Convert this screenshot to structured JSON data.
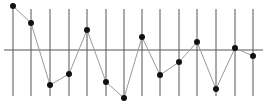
{
  "chart_data": {
    "type": "line",
    "title": "",
    "xlabel": "",
    "ylabel": "",
    "grid": "vertical lines at each point, horizontal baseline at 0",
    "legend": "none",
    "x": [
      1,
      2,
      3,
      4,
      5,
      6,
      7,
      8,
      9,
      10,
      11,
      12,
      13,
      14
    ],
    "values": [
      4.4,
      2.7,
      -3.5,
      -2.4,
      2.0,
      -3.2,
      -4.8,
      1.3,
      -2.5,
      -1.2,
      0.8,
      -3.9,
      0.2,
      -0.6
    ],
    "ylim": [
      -5,
      5
    ],
    "baseline": 0
  },
  "layout": {
    "width": 265,
    "height": 109,
    "x_px": [
      13,
      31,
      50,
      69,
      87,
      106,
      124,
      142,
      160,
      179,
      197,
      216,
      235,
      253
    ],
    "y_zero_px": 50,
    "y_scale_px_per_unit": 10,
    "vline_top": 9,
    "vline_bottom": 96,
    "hline_x1": 4,
    "hline_x2": 263
  },
  "colors": {
    "line": "#999999",
    "grid": "#555555",
    "baseline": "#555555",
    "marker": "#111111"
  }
}
